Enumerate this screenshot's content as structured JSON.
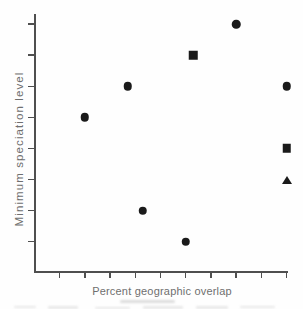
{
  "figure": {
    "background": "#fefefe",
    "marker_color": "#1a1a1a",
    "axis_color": "#4f4f4f",
    "label_color": "#6f6f6f"
  },
  "chart_data": {
    "type": "scatter",
    "title": "",
    "xlabel": "Percent geographic overlap",
    "ylabel": "Minimum speciation level",
    "grid": false,
    "legend": "none",
    "x_axis": {
      "range": [
        0,
        100
      ],
      "tick_interval": 10,
      "tick_labels_visible": false
    },
    "y_axis": {
      "range": [
        1,
        8
      ],
      "tick_count": 8,
      "tick_labels_visible": false
    },
    "series": [
      {
        "name": "circle-points",
        "marker": "circle",
        "points": [
          {
            "x": 80,
            "y": 8
          },
          {
            "x": 37,
            "y": 6
          },
          {
            "x": 100,
            "y": 6
          },
          {
            "x": 20,
            "y": 5
          },
          {
            "x": 43,
            "y": 2
          },
          {
            "x": 60,
            "y": 1
          }
        ]
      },
      {
        "name": "square-points",
        "marker": "square",
        "points": [
          {
            "x": 63,
            "y": 7
          },
          {
            "x": 100,
            "y": 4
          }
        ]
      },
      {
        "name": "triangle-points",
        "marker": "triangle",
        "points": [
          {
            "x": 100,
            "y": 3
          }
        ]
      }
    ]
  }
}
